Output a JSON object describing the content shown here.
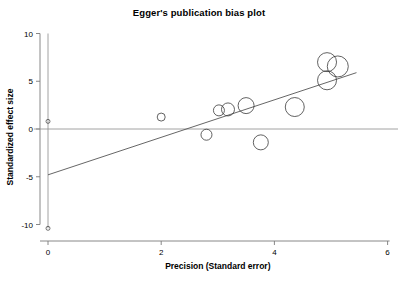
{
  "chart_data": {
    "type": "scatter",
    "title": "Egger's publication bias plot",
    "xlabel": "Precision (Standard error)",
    "ylabel": "Standardized effect size",
    "xlim": [
      -0.3,
      6.3
    ],
    "ylim": [
      -11.5,
      10.8
    ],
    "xticks": [
      0,
      2,
      4,
      6
    ],
    "xtick_labels": [
      "0",
      "2",
      "4",
      "6"
    ],
    "yticks": [
      -10,
      -5,
      0,
      5,
      10
    ],
    "ytick_labels": [
      "-10",
      "-5",
      "0",
      "5",
      "10"
    ],
    "grid": false,
    "legend": "none",
    "reference_line": {
      "name": "zero-effect-line",
      "orientation": "horizontal",
      "y": 0,
      "x_start": -0.25,
      "x_end": 6.25
    },
    "ci_line": {
      "name": "intercept-confidence-interval",
      "orientation": "vertical",
      "x": 0,
      "y_start": -10.4,
      "y_end": 10.0
    },
    "regression_line": {
      "name": "egger-regression-line",
      "x_start": 0.0,
      "y_start": -4.8,
      "x_end": 5.45,
      "y_end": 5.9,
      "slope": 1.96,
      "intercept": -4.8
    },
    "points": [
      {
        "label": "ci-endpoint-upper",
        "x": 0.0,
        "y": 0.8,
        "size": 2.0
      },
      {
        "label": "ci-endpoint-lower",
        "x": 0.0,
        "y": -10.4,
        "size": 2.0
      },
      {
        "label": "study-1",
        "x": 2.0,
        "y": 1.25,
        "size": 4.0
      },
      {
        "label": "study-2",
        "x": 2.8,
        "y": -0.6,
        "size": 5.5
      },
      {
        "label": "study-3",
        "x": 3.02,
        "y": 1.95,
        "size": 5.5
      },
      {
        "label": "study-4",
        "x": 3.18,
        "y": 2.05,
        "size": 6.5
      },
      {
        "label": "study-5",
        "x": 3.5,
        "y": 2.45,
        "size": 8.0
      },
      {
        "label": "study-6",
        "x": 3.76,
        "y": -1.4,
        "size": 7.5
      },
      {
        "label": "study-7",
        "x": 4.36,
        "y": 2.3,
        "size": 9.5
      },
      {
        "label": "study-8",
        "x": 4.93,
        "y": 5.1,
        "size": 9.5
      },
      {
        "label": "study-9",
        "x": 4.93,
        "y": 7.0,
        "size": 9.5
      },
      {
        "label": "study-10",
        "x": 5.12,
        "y": 6.55,
        "size": 10.5
      }
    ]
  }
}
